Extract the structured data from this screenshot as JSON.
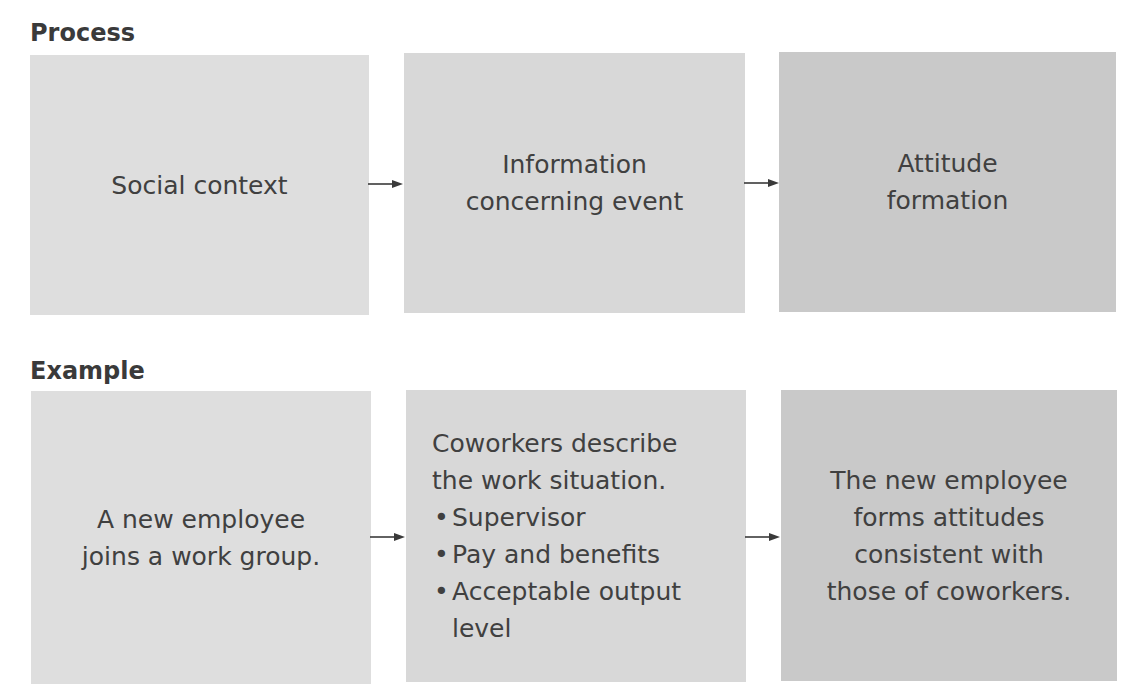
{
  "process": {
    "title": "Process",
    "boxes": [
      {
        "text": "Social context",
        "color": "#dedede"
      },
      {
        "text": "Information\nconcerning event",
        "color": "#d8d8d8"
      },
      {
        "text": "Attitude\nformation",
        "color": "#c9c9c9"
      }
    ]
  },
  "example": {
    "title": "Example",
    "boxes": [
      {
        "text": "A new employee\njoins a work group.",
        "color": "#dedede"
      },
      {
        "lead": "Coworkers describe\nthe work situation.",
        "bullet": "•",
        "items": [
          "Supervisor",
          "Pay and benefits",
          "Acceptable output\nlevel"
        ],
        "color": "#d8d8d8"
      },
      {
        "text": "The new employee\nforms attitudes\nconsistent with\nthose of coworkers.",
        "color": "#c9c9c9"
      }
    ]
  },
  "arrow_color": "#3a3a3a"
}
